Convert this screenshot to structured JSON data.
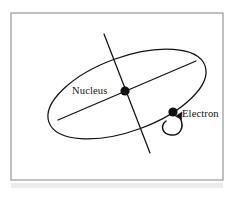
{
  "figure": {
    "background_color": "#ffffff",
    "border_color": "#8d8d8d",
    "stroke_color": "#111111",
    "smudge_color": "#e6e6e6",
    "frame": {
      "x": 11,
      "y": 13,
      "width": 212,
      "height": 167
    },
    "labels": [
      {
        "id": "nucleus",
        "text": "Nucleus",
        "x": 72,
        "y": 94,
        "anchor": "start"
      },
      {
        "id": "electron",
        "text": "Electron",
        "x": 182,
        "y": 117,
        "anchor": "start"
      }
    ],
    "orbit": {
      "name": "electron-orbit-ellipse",
      "cx": 127,
      "cy": 94,
      "rx": 83,
      "ry": 37,
      "rotation": -20
    },
    "axis_major": {
      "name": "major-axis-line",
      "x1": 58,
      "y1": 120,
      "x2": 196,
      "y2": 61
    },
    "axis_spin": {
      "name": "spin-axis-line",
      "x1": 104,
      "y1": 34,
      "x2": 150,
      "y2": 153
    },
    "nucleus_dot": {
      "name": "nucleus-dot",
      "cx": 125,
      "cy": 91,
      "r": 4.6
    },
    "electron_dot": {
      "name": "electron-dot",
      "cx": 173,
      "cy": 112,
      "r": 4.6
    },
    "spin_arrow": {
      "name": "electron-spin-arrow",
      "path": "M 180 118 C 185 127, 180 136, 171 135 C 162 134, 160 126, 166 121",
      "arrow_head": "M 182 112 L 181.5 119.5 L 175.5 116.2 Z"
    },
    "bottom_smudge": {
      "x": 11,
      "y": 183,
      "width": 212,
      "height": 5
    }
  }
}
